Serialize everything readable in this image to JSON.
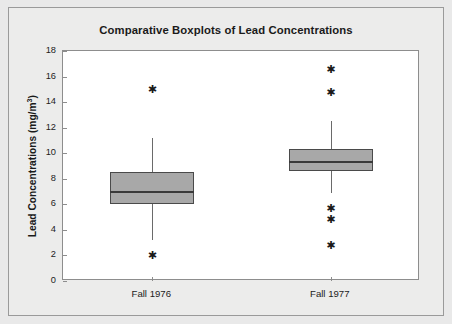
{
  "chart_data": {
    "type": "box",
    "title": "Comparative Boxplots of Lead Concentrations",
    "xlabel": "",
    "ylabel": "Lead Concentrations (mg/m³)",
    "ylabel_base": "Lead Concentrations (mg/m",
    "ylabel_sup": "3",
    "ylabel_close": ")",
    "categories": [
      "Fall 1976",
      "Fall 1977"
    ],
    "ylim": [
      0,
      18
    ],
    "yticks": [
      0,
      2,
      4,
      6,
      8,
      10,
      12,
      14,
      16,
      18
    ],
    "ytick_labels": [
      "0",
      "2",
      "4",
      "6",
      "8",
      "10",
      "12",
      "14",
      "16",
      "18"
    ],
    "grid": false,
    "legend": null,
    "boxes": [
      {
        "name": "Fall 1976",
        "whisker_low": 3.2,
        "q1": 6.05,
        "median": 7.0,
        "q3": 8.5,
        "whisker_high": 11.2,
        "outliers": [
          15.05,
          2.05
        ]
      },
      {
        "name": "Fall 1977",
        "whisker_low": 6.9,
        "q1": 8.6,
        "median": 9.35,
        "q3": 10.3,
        "whisker_high": 12.5,
        "outliers": [
          16.6,
          14.8,
          5.7,
          4.85,
          2.85
        ]
      }
    ]
  },
  "style": {
    "box_fill": "#a8a8a8",
    "box_stroke": "#4a4a4a",
    "median_stroke": "#3a3a3a",
    "whisker_stroke": "#6a6a6a",
    "outlier_glyph": "✱",
    "plot_bg": "#ffffff",
    "figure_bg": "#ececeb",
    "axis_stroke": "#8d8d8d",
    "text_color": "#1a1a1a"
  }
}
